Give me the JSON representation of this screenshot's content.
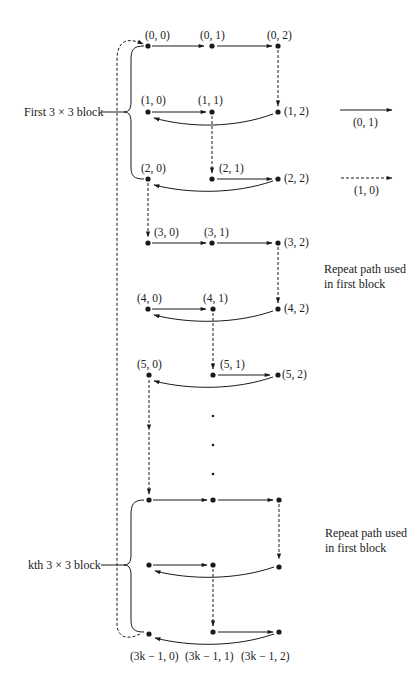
{
  "diagram": {
    "block_labels": {
      "first": "First 3 × 3 block",
      "kth": "kth 3 × 3 block"
    },
    "repeat_notes": [
      "Repeat path used\nin first block",
      "Repeat path used\nin first block"
    ],
    "legend": [
      {
        "style": "solid",
        "label": "(0, 1)"
      },
      {
        "style": "dashed",
        "label": "(1, 0)"
      }
    ],
    "node_labels": {
      "n00": "(0, 0)",
      "n01": "(0, 1)",
      "n02": "(0, 2)",
      "n10": "(1, 0)",
      "n11": "(1, 1)",
      "n12": "(1, 2)",
      "n20": "(2, 0)",
      "n21": "(2, 1)",
      "n22": "(2, 2)",
      "n30": "(3, 0)",
      "n31": "(3, 1)",
      "n32": "(3, 2)",
      "n40": "(4, 0)",
      "n41": "(4, 1)",
      "n42": "(4, 2)",
      "n50": "(5, 0)",
      "n51": "(5, 1)",
      "n52": "(5, 2)",
      "k0": "(3k − 1, 0)",
      "k1": "(3k − 1, 1)",
      "k2": "(3k − 1, 2)"
    },
    "ellipsis": "⋮",
    "colors": {
      "ink": "#1a1a1a",
      "background": "#ffffff"
    }
  }
}
